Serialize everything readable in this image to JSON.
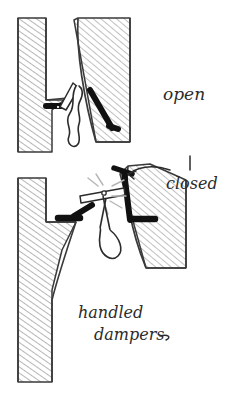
{
  "figure": {
    "title": "handled dampers",
    "kind": "hand-drawn technical sketch",
    "background_color": "#ffffff",
    "ink_color": "#2b2b2b",
    "blade_color": "#111111",
    "hatch_color": "#6e6e6e"
  },
  "labels": {
    "open": "open",
    "closed": "closed",
    "caption_line1": "handled",
    "caption_line2": "dampers"
  },
  "panels": [
    {
      "id": "open-panel",
      "state": "open",
      "label": "open",
      "description": "Duct throat with damper blade rotated parallel to airflow; wavy S-shaped handle hangs in the gap.",
      "blade_orientation": "diagonal, parallel to duct wall",
      "handle_shape": "wavy S-curve with rounded loop"
    },
    {
      "id": "closed-panel",
      "state": "closed",
      "label": "closed",
      "description": "Duct throat with damper blade rotated across the opening; lever arm horizontal with hanging loop handle and motion dashes at the pivot.",
      "blade_orientation": "across the throat, blocking flow",
      "handle_shape": "straight lever with elongated loop grip",
      "annotation": "curved arrow pointing to the closed blade"
    }
  ]
}
